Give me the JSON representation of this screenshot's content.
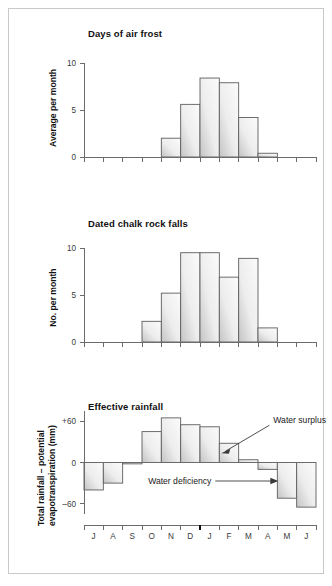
{
  "figure": {
    "background": "#ffffff",
    "border_color": "#c9c9c9",
    "bar_fill_light": "#f4f4f4",
    "bar_fill_dark": "#c4c4c4",
    "bar_stroke": "#5e5e5e",
    "axis_color": "#6b6b6b"
  },
  "months": [
    "J",
    "A",
    "S",
    "O",
    "N",
    "D",
    "J",
    "F",
    "M",
    "A",
    "M",
    "J"
  ],
  "year_break_after_index": 5,
  "chart_data": [
    {
      "type": "bar",
      "title": "Days of air frost",
      "xlabel": "",
      "ylabel": "Average per month",
      "categories": [
        "J",
        "A",
        "S",
        "O",
        "N",
        "D",
        "J",
        "F",
        "M",
        "A",
        "M",
        "J"
      ],
      "values": [
        0,
        0,
        0,
        0,
        2.0,
        5.6,
        8.4,
        7.9,
        4.2,
        0.4,
        0,
        0
      ],
      "ylim": [
        0,
        10
      ],
      "yticks": [
        0,
        5,
        10
      ],
      "ytick_labels": [
        "0",
        "5",
        "10"
      ],
      "grid": false,
      "legend": "none"
    },
    {
      "type": "bar",
      "title": "Dated chalk rock falls",
      "xlabel": "",
      "ylabel": "No. per month",
      "categories": [
        "J",
        "A",
        "S",
        "O",
        "N",
        "D",
        "J",
        "F",
        "M",
        "A",
        "M",
        "J"
      ],
      "values": [
        0,
        0,
        0,
        2.2,
        5.2,
        9.5,
        9.5,
        6.9,
        8.9,
        1.5,
        0,
        0
      ],
      "ylim": [
        0,
        10
      ],
      "yticks": [
        0,
        5,
        10
      ],
      "ytick_labels": [
        "0",
        "5",
        "10"
      ],
      "grid": false,
      "legend": "none"
    },
    {
      "type": "bar",
      "title": "Effective rainfall",
      "xlabel": "",
      "ylabel": "Total rainfall – potential evapotranspiration (mm)",
      "ylabel_line1": "Total rainfall – potential",
      "ylabel_line2": "evapotranspiration (mm)",
      "categories": [
        "J",
        "A",
        "S",
        "O",
        "N",
        "D",
        "J",
        "F",
        "M",
        "A",
        "M",
        "J"
      ],
      "values": [
        -40,
        -30,
        -2,
        45,
        65,
        55,
        52,
        28,
        4,
        -10,
        -52,
        -65
      ],
      "ylim": [
        -75,
        75
      ],
      "yticks": [
        -60,
        0,
        60
      ],
      "ytick_labels": [
        "–60",
        "0",
        "+60"
      ],
      "grid": false,
      "legend": "none",
      "annotations": [
        {
          "label": "Water surplus",
          "points_to_category": "F"
        },
        {
          "label": "Water deficiency",
          "points_to_category": "M"
        }
      ]
    }
  ]
}
